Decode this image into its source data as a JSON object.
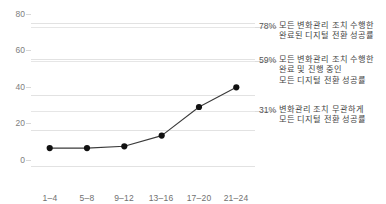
{
  "chart_data": {
    "type": "line",
    "title": "",
    "subtitle": "",
    "xlabel": "",
    "ylabel": "",
    "categories": [
      "1–4",
      "5–8",
      "9–12",
      "13–16",
      "17–20",
      "21–24"
    ],
    "values": [
      10,
      10,
      11,
      17,
      33,
      44
    ],
    "series": [
      {
        "name": "",
        "values": [
          10,
          10,
          11,
          17,
          33,
          44
        ]
      }
    ],
    "ylim": [
      0,
      85
    ],
    "yticks": [
      0,
      20,
      40,
      60,
      80
    ],
    "ytick_labels": [
      "0",
      "20",
      "40",
      "60",
      "80"
    ],
    "grid": true,
    "legend": "none",
    "marker": "circle",
    "line_color": "#3a3a3a",
    "marker_color": "#111111",
    "grid_color": "#e9e9e9",
    "annotation_lines": [
      78,
      59,
      31
    ],
    "annotations": [
      {
        "value": 78,
        "percent_label": "78%",
        "text": "모든 변화관리 조치 수행한\n완료된 디지털 전환 성공률"
      },
      {
        "value": 59,
        "percent_label": "59%",
        "text": "모든 변화관리 조치 수행한\n완료 및 진행 중인\n모든 디지털 전환 성공률"
      },
      {
        "value": 31,
        "percent_label": "31%",
        "text": "변화관리 조치 무관하게\n모든 디지털 전환 성공률"
      }
    ]
  },
  "axis": {
    "y_labels": [
      "80",
      "60",
      "40",
      "20",
      "0"
    ],
    "x_labels": [
      "1–4",
      "5–8",
      "9–12",
      "13–16",
      "17–20",
      "21–24"
    ]
  },
  "colors": {
    "grid": "#e9e9e9",
    "line": "#3a3a3a",
    "marker": "#111111",
    "tick_text": "#7b7b7b",
    "annotation_text": "#444444",
    "leader": "#dcdcdc",
    "background": "#ffffff"
  }
}
